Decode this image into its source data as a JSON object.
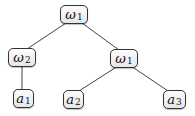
{
  "tree": {
    "nodes": [
      {
        "id": "root",
        "symbol": "ω",
        "subscript": "1"
      },
      {
        "id": "left",
        "symbol": "ω",
        "subscript": "2"
      },
      {
        "id": "right",
        "symbol": "ω",
        "subscript": "1"
      },
      {
        "id": "leaf1",
        "symbol": "a",
        "subscript": "1"
      },
      {
        "id": "leaf2",
        "symbol": "a",
        "subscript": "2"
      },
      {
        "id": "leaf3",
        "symbol": "a",
        "subscript": "3"
      }
    ],
    "edges": [
      [
        "root",
        "left"
      ],
      [
        "root",
        "right"
      ],
      [
        "left",
        "leaf1"
      ],
      [
        "right",
        "leaf2"
      ],
      [
        "right",
        "leaf3"
      ]
    ]
  }
}
